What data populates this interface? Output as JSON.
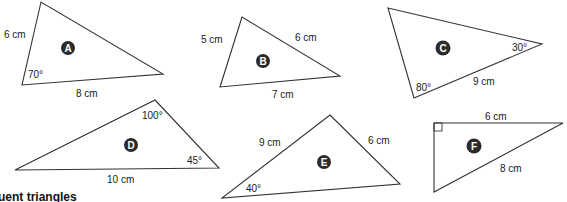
{
  "colors": {
    "stroke": "#333333",
    "badge": "#2b2b2b",
    "text": "#1a1a1a"
  },
  "caption": "gruent triangles",
  "triangles": [
    {
      "id": "A",
      "labels": {
        "side1": "6 cm",
        "side2": "8 cm",
        "angle1": "70°"
      }
    },
    {
      "id": "B",
      "labels": {
        "side1": "5 cm",
        "side2": "6 cm",
        "side3": "7 cm"
      }
    },
    {
      "id": "C",
      "labels": {
        "angle1": "30°",
        "angle2": "80°",
        "side1": "9 cm"
      }
    },
    {
      "id": "D",
      "labels": {
        "angle1": "100°",
        "angle2": "45°",
        "side1": "10 cm"
      }
    },
    {
      "id": "E",
      "labels": {
        "side1": "9 cm",
        "side2": "6 cm",
        "angle1": "40°"
      }
    },
    {
      "id": "F",
      "labels": {
        "side1": "6 cm",
        "side2": "8 cm",
        "right_angle": "90°"
      }
    }
  ]
}
